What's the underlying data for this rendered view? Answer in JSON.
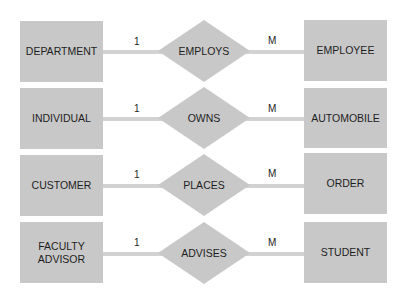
{
  "diagram": {
    "type": "entity-relationship",
    "colors": {
      "entity_fill": "#c8c8c8",
      "relationship_fill": "#c8c8c8",
      "connector": "#d2d2d2",
      "text": "#1e1e1e"
    },
    "rows": [
      {
        "left_entity": "DEPARTMENT",
        "relationship": "EMPLOYS",
        "right_entity": "EMPLOYEE",
        "left_cardinality": "1",
        "right_cardinality": "M"
      },
      {
        "left_entity": "INDIVIDUAL",
        "relationship": "OWNS",
        "right_entity": "AUTOMOBILE",
        "left_cardinality": "1",
        "right_cardinality": "M"
      },
      {
        "left_entity": "CUSTOMER",
        "relationship": "PLACES",
        "right_entity": "ORDER",
        "left_cardinality": "1",
        "right_cardinality": "M"
      },
      {
        "left_entity_line1": "FACULTY",
        "left_entity_line2": "ADVISOR",
        "relationship": "ADVISES",
        "right_entity": "STUDENT",
        "left_cardinality": "1",
        "right_cardinality": "M"
      }
    ]
  }
}
